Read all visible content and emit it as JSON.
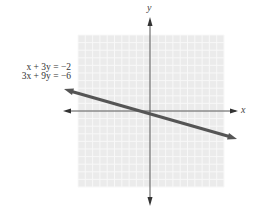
{
  "chart_data": {
    "type": "line",
    "title": "",
    "xlabel": "x",
    "ylabel": "y",
    "grid": true,
    "xlim": [
      -10,
      10
    ],
    "ylim": [
      -10,
      10
    ],
    "tick_labels": false,
    "series": [
      {
        "name": "x + 3y = −2 / 3x + 9y = −6",
        "equation_slope": -0.3333,
        "equation_intercept": -0.6667,
        "x": [
          -12,
          12
        ],
        "y": [
          3.33,
          -4.67
        ],
        "color": "#555555"
      }
    ],
    "annotations": [
      "x + 3y = −2",
      "3x + 9y = −6"
    ]
  },
  "labels": {
    "eq1": "x + 3y = −2",
    "eq2": "3x + 9y = −6",
    "x_axis": "x",
    "y_axis": "y"
  },
  "colors": {
    "grid_bg": "#ebebeb",
    "grid_line": "#f8f8f8",
    "axis": "#444444",
    "line": "#555555"
  }
}
